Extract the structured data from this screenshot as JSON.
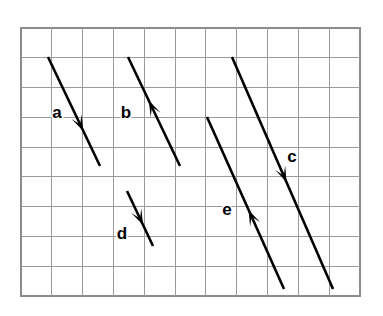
{
  "figure": {
    "background_color": "#ffffff"
  },
  "grid": {
    "name": "square-grid",
    "x": 21,
    "y": 28,
    "width": 339,
    "height": 268,
    "columns": 11,
    "rows": 9,
    "cell_width": 30.82,
    "cell_height": 29.78,
    "line_color": "#9a9a9a",
    "border_color": "#8c8c8c",
    "fill_color": "#ffffff"
  },
  "vectors": [
    {
      "id": "a",
      "label": "a",
      "label_x": 57,
      "label_y": 118,
      "tail_x": 48,
      "tail_y": 57,
      "tip_x": 100,
      "tip_y": 166,
      "head_at": 0.68,
      "direction": "down-right",
      "color": "#000000"
    },
    {
      "id": "b",
      "label": "b",
      "label_x": 126,
      "label_y": 118,
      "tail_x": 180,
      "tail_y": 166,
      "tip_x": 128,
      "tip_y": 57,
      "head_at": 0.6,
      "direction": "up-left",
      "color": "#000000"
    },
    {
      "id": "c",
      "label": "c",
      "label_x": 292,
      "label_y": 162,
      "tail_x": 232,
      "tail_y": 57,
      "tip_x": 333,
      "tip_y": 289,
      "head_at": 0.54,
      "direction": "down-right",
      "color": "#000000"
    },
    {
      "id": "d",
      "label": "d",
      "label_x": 122,
      "label_y": 239,
      "tail_x": 127,
      "tail_y": 191,
      "tip_x": 153,
      "tip_y": 246,
      "head_at": 0.62,
      "direction": "down-right",
      "color": "#000000"
    },
    {
      "id": "e",
      "label": "e",
      "label_x": 227,
      "label_y": 215,
      "tail_x": 284,
      "tail_y": 289,
      "tip_x": 207,
      "tip_y": 117,
      "head_at": 0.46,
      "direction": "up-left",
      "color": "#000000"
    }
  ]
}
